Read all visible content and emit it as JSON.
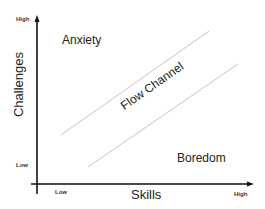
{
  "diagram": {
    "type": "flow-channel-model",
    "y_axis": {
      "title": "Challenges",
      "high_label": "High",
      "low_label": "Low"
    },
    "x_axis": {
      "title": "Skills",
      "high_label": "High",
      "low_label": "Low"
    },
    "regions": {
      "anxiety": "Anxiety",
      "flow": "Flow Channel",
      "boredom": "Boredom"
    },
    "colors": {
      "axis": "#111111",
      "channel_line": "#bdbdbd",
      "text": "#222222"
    }
  }
}
